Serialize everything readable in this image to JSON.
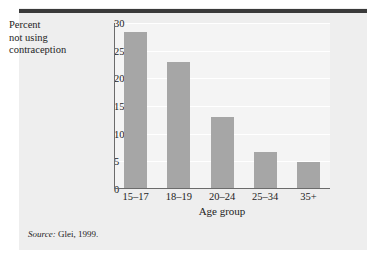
{
  "figure": {
    "y_axis_label_lines": [
      "Percent",
      "not using",
      "contraception"
    ],
    "x_title": "Age group",
    "source_label": "Source:",
    "source_text": " Glei, 1999.",
    "bar_color": "#a6a6a6",
    "rule_color": "#3a3a3a",
    "panel_color": "#eeeeee",
    "plot_color": "#f4f4f4"
  },
  "chart_data": {
    "type": "bar",
    "title": "",
    "categories": [
      "15–17",
      "18–19",
      "20–24",
      "25–34",
      "35+"
    ],
    "values": [
      28.3,
      23.0,
      13.0,
      6.5,
      4.8
    ],
    "xlabel": "Age group",
    "ylabel": "Percent not using contraception",
    "ylim": [
      0,
      30
    ],
    "yticks": [
      0,
      5,
      10,
      15,
      20,
      25,
      30
    ],
    "ytick_labels": [
      "0",
      "5",
      "10",
      "15",
      "20",
      "25",
      "30"
    ],
    "grid": true,
    "legend": "none",
    "source": "Source: Glei, 1999."
  }
}
